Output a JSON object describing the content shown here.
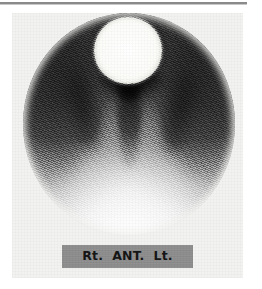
{
  "figure": {
    "modality": "planar-gamma-camera-scintigram",
    "view_label_band": {
      "right_marker": "Rt.",
      "projection": "ANT.",
      "left_marker": "Lt.",
      "band_color": "#8e8e8e",
      "text_color": "#151515"
    },
    "field_of_view": {
      "shape": "circle",
      "note": "circular gamma camera field of view"
    },
    "regions": [
      {
        "name": "hot-focal-uptake",
        "position": "superior-midline",
        "intensity": "maximum"
      },
      {
        "name": "photopenic-crescent",
        "position": "inferior-to-focus",
        "intensity": "minimum"
      },
      {
        "name": "midline-column",
        "position": "central-vertical",
        "intensity": "high"
      },
      {
        "name": "left-lateral-activity",
        "position": "lateral-left",
        "intensity": "high"
      },
      {
        "name": "right-lateral-activity",
        "position": "lateral-right",
        "intensity": "high"
      },
      {
        "name": "inferior-soft-tissue",
        "position": "inferior",
        "intensity": "low"
      }
    ],
    "colors": {
      "background": "#ffffff",
      "panel": "#f2f2f0",
      "top_rule": "#8a8a8a",
      "hot_focus": "#ffffff",
      "darkest": "#000000"
    }
  }
}
